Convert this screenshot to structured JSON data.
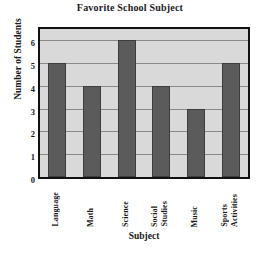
{
  "chart_data": {
    "type": "bar",
    "title": "Favorite School Subject",
    "xlabel": "Subject",
    "ylabel": "Number of Students",
    "categories": [
      "Language",
      "Math",
      "Science",
      "Social Studies",
      "Music",
      "Sports Activities"
    ],
    "values": [
      5,
      4,
      6,
      4,
      3,
      5
    ],
    "ytick_labels": [
      "0",
      "1",
      "2",
      "3",
      "4",
      "5",
      "6"
    ],
    "ytick_values": [
      0,
      1,
      2,
      3,
      4,
      5,
      6
    ],
    "ylim": [
      0,
      6.5
    ],
    "grid": true,
    "legend": "none",
    "colors": {
      "bar": "#5b5b5b",
      "bar_edge": "#3c3c3c",
      "plot_background": "#d9d9d9",
      "gridline": "#8a8a8a",
      "axis_border": "#111111",
      "text": "#1a1a1a",
      "page_background": "#ffffff"
    }
  }
}
